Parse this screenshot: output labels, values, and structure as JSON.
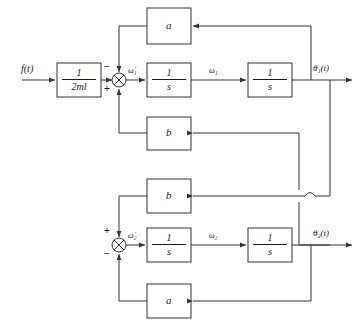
{
  "diagram": {
    "type": "control-block-diagram",
    "stroke_color": "#333333",
    "background": "#ffffff"
  },
  "input": {
    "label": "f(t)",
    "gain_block": {
      "name": "gain-1-over-2ml",
      "numerator": "1",
      "denominator": "2ml"
    }
  },
  "branch1": {
    "summing_junction": {
      "name": "sum-1",
      "sign_top": "−",
      "sign_bottom": "+",
      "output_label": "ω̇₁"
    },
    "integrator_1": {
      "numerator": "1",
      "denominator": "s"
    },
    "mid_label": "ω₁",
    "integrator_2": {
      "numerator": "1",
      "denominator": "s"
    },
    "output_label": "θ₁(t)",
    "feedback_top": "a",
    "feedback_bottom": "b"
  },
  "branch2": {
    "summing_junction": {
      "name": "sum-2",
      "sign_top": "+",
      "sign_bottom": "−",
      "output_label": "ω̇₂"
    },
    "integrator_1": {
      "numerator": "1",
      "denominator": "s"
    },
    "mid_label": "ω₂",
    "integrator_2": {
      "numerator": "1",
      "denominator": "s"
    },
    "output_label": "θ₂(t)",
    "feedback_top": "b",
    "feedback_bottom": "a"
  }
}
